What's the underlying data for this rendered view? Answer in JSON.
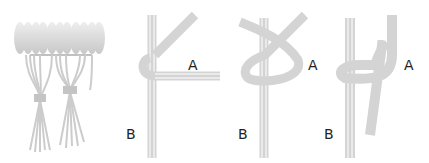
{
  "diagram": {
    "colors": {
      "cord": "#d4d4d4",
      "cord_stripe": "#ffffff",
      "fringe": "#cfcfcf",
      "label": "#222222"
    },
    "panels": [
      {
        "id": "finished-fringe",
        "labels": []
      },
      {
        "id": "step-1",
        "labels": [
          {
            "text": "A"
          },
          {
            "text": "B"
          }
        ]
      },
      {
        "id": "step-2",
        "labels": [
          {
            "text": "A"
          },
          {
            "text": "B"
          }
        ]
      },
      {
        "id": "step-3",
        "labels": [
          {
            "text": "A"
          },
          {
            "text": "B"
          }
        ]
      }
    ]
  }
}
